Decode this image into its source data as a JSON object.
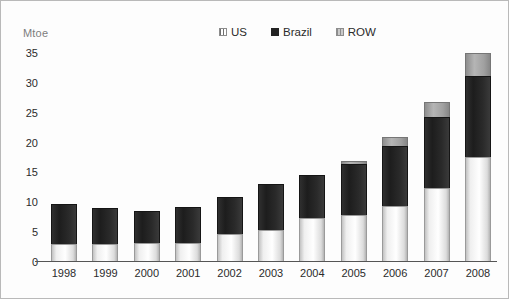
{
  "figure": {
    "unit_label": "Mtoe",
    "border_color": "#b9b9b9"
  },
  "legend": {
    "position": "top-center",
    "entries": [
      {
        "label": "US",
        "swatch": "us-hatch-swatch",
        "color": "#f2f2f2"
      },
      {
        "label": "Brazil",
        "swatch": "brazil-solid-swatch",
        "color": "#232323"
      },
      {
        "label": "ROW",
        "swatch": "row-gray-swatch",
        "color": "#a0a0a0"
      }
    ]
  },
  "yaxis": {
    "ticks": [
      "35",
      "30",
      "25",
      "20",
      "15",
      "10",
      "5",
      "0"
    ]
  },
  "chart_data": {
    "type": "bar",
    "stacked": true,
    "title": "",
    "subtitle": "",
    "xlabel": "",
    "ylabel": "Mtoe",
    "ylim": [
      0,
      35
    ],
    "ytick_step": 5,
    "grid": false,
    "legend_position": "top-center",
    "categories": [
      "1998",
      "1999",
      "2000",
      "2001",
      "2002",
      "2003",
      "2004",
      "2005",
      "2006",
      "2007",
      "2008"
    ],
    "series": [
      {
        "name": "US",
        "values": [
          2.9,
          2.9,
          3.1,
          3.1,
          4.5,
          5.3,
          7.3,
          7.7,
          9.3,
          12.3,
          17.8
        ]
      },
      {
        "name": "Brazil",
        "values": [
          6.7,
          6.1,
          5.3,
          6.0,
          6.3,
          7.7,
          7.1,
          8.6,
          10.0,
          12.0,
          13.7
        ]
      },
      {
        "name": "ROW",
        "values": [
          0.0,
          0.0,
          0.0,
          0.0,
          0.0,
          0.0,
          0.0,
          0.5,
          1.5,
          2.4,
          4.0
        ]
      }
    ],
    "totals": [
      9.6,
      9.0,
      8.4,
      9.1,
      10.8,
      13.0,
      14.4,
      16.8,
      20.8,
      26.7,
      35.5
    ]
  }
}
